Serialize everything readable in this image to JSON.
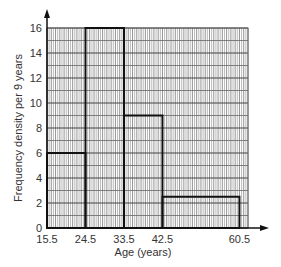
{
  "chart_data": {
    "type": "histogram",
    "title": "",
    "xlabel": "Age (years)",
    "ylabel": "Frequency density per 9 years",
    "x_ticks": [
      15.5,
      24.5,
      33.5,
      42.5,
      60.5
    ],
    "x_tick_labels": [
      "15.5",
      "24.5",
      "33.5",
      "42.5",
      "60.5"
    ],
    "y_ticks": [
      0,
      2,
      4,
      6,
      8,
      10,
      12,
      14,
      16
    ],
    "y_tick_labels": [
      "0",
      "2",
      "4",
      "6",
      "8",
      "10",
      "12",
      "14",
      "16"
    ],
    "xlim": [
      15.5,
      62.5
    ],
    "ylim": [
      0,
      16
    ],
    "grid": true,
    "bins": [
      {
        "start": 15.5,
        "end": 24.5,
        "value": 6
      },
      {
        "start": 24.5,
        "end": 33.5,
        "value": 16
      },
      {
        "start": 33.5,
        "end": 42.5,
        "value": 9
      },
      {
        "start": 42.5,
        "end": 60.5,
        "value": 2.5
      }
    ]
  }
}
